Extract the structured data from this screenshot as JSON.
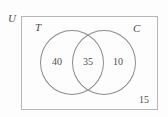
{
  "diagram": {
    "type": "venn-two-set",
    "universe": {
      "label": "U",
      "outside_count": "15"
    },
    "sets": [
      {
        "key": "T",
        "label": "T",
        "only_count": "40"
      },
      {
        "key": "C",
        "label": "C",
        "only_count": "10"
      }
    ],
    "intersection": {
      "label": "T ∩ C",
      "count": "35"
    },
    "colors": {
      "rectangle_stroke": "#b6b6b6",
      "circle_stroke": "#8c8c8c",
      "text": "#4f4f4f",
      "background": "#fdfdfd"
    }
  }
}
